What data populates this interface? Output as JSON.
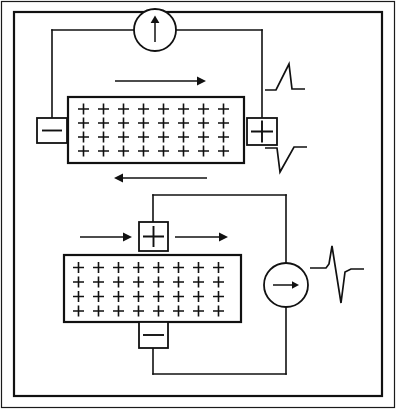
{
  "figure": {
    "title": "Membrane depolarization circuit diagram",
    "background_color": "#ffffff",
    "line_color": "#111111",
    "border": {
      "outer_stroke": "#1a1a1a",
      "inner_stroke": "#111111"
    },
    "width": 396,
    "height": 409
  },
  "panels": [
    {
      "id": "top-panel",
      "name": "Longitudinal current flow configuration",
      "membrane": {
        "name": "charged-membrane-top",
        "charge_symbol": "+",
        "rows": 4,
        "columns": 8,
        "total_charges": 32
      },
      "electrodes": [
        {
          "id": "top-left-electrode",
          "polarity": "negative",
          "symbol": "−",
          "position": "left"
        },
        {
          "id": "top-right-electrode",
          "polarity": "positive",
          "symbol": "+",
          "position": "right"
        }
      ],
      "meter": {
        "id": "top-meter",
        "type": "galvanometer",
        "needle_direction": "up",
        "needle_symbol": "↑"
      },
      "flow_arrows": [
        {
          "id": "top-arrow-above",
          "direction": "right",
          "symbol": "→",
          "position": "above-membrane"
        },
        {
          "id": "top-arrow-below",
          "direction": "left",
          "symbol": "←",
          "position": "below-membrane"
        }
      ],
      "traces": [
        {
          "id": "trace-positive-spike",
          "name": "positive-deflection-trace",
          "polarity": "positive",
          "shape": "monophasic upward spike"
        },
        {
          "id": "trace-negative-spike",
          "name": "negative-deflection-trace",
          "polarity": "negative",
          "shape": "monophasic downward spike"
        }
      ]
    },
    {
      "id": "bottom-panel",
      "name": "Transverse current flow configuration",
      "membrane": {
        "name": "charged-membrane-bottom",
        "charge_symbol": "+",
        "rows": 4,
        "columns": 8,
        "total_charges": 32
      },
      "electrodes": [
        {
          "id": "bottom-top-electrode",
          "polarity": "positive",
          "symbol": "+",
          "position": "top"
        },
        {
          "id": "bottom-bottom-electrode",
          "polarity": "negative",
          "symbol": "−",
          "position": "bottom"
        }
      ],
      "meter": {
        "id": "bottom-meter",
        "type": "galvanometer",
        "needle_direction": "right",
        "needle_symbol": "→"
      },
      "flow_arrows": [
        {
          "id": "bottom-arrow-left",
          "direction": "right",
          "symbol": "→",
          "position": "left-of-electrode"
        },
        {
          "id": "bottom-arrow-right",
          "direction": "right",
          "symbol": "→",
          "position": "right-of-electrode"
        }
      ],
      "traces": [
        {
          "id": "trace-biphasic",
          "name": "biphasic-deflection-trace",
          "polarity": "biphasic",
          "shape": "upward spike followed by downward spike"
        }
      ]
    }
  ]
}
